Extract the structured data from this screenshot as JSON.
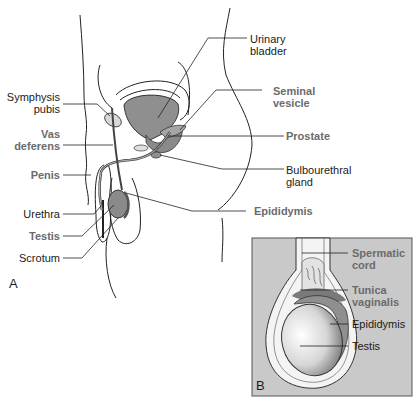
{
  "figure": {
    "panel_a": {
      "letter": "A",
      "labels_left": [
        {
          "id": "symphysis-pubis",
          "line1": "Symphysis",
          "line2": "pubis",
          "emphasis": false
        },
        {
          "id": "vas-deferens",
          "line1": "Vas",
          "line2": "deferens",
          "emphasis": true
        },
        {
          "id": "penis",
          "line1": "Penis",
          "emphasis": true
        },
        {
          "id": "urethra",
          "line1": "Urethra",
          "emphasis": false
        },
        {
          "id": "testis",
          "line1": "Testis",
          "emphasis": true
        },
        {
          "id": "scrotum",
          "line1": "Scrotum",
          "emphasis": false
        }
      ],
      "labels_right": [
        {
          "id": "urinary-bladder",
          "line1": "Urinary",
          "line2": "bladder",
          "emphasis": false
        },
        {
          "id": "seminal-vesicle",
          "line1": "Seminal",
          "line2": "vesicle",
          "emphasis": true
        },
        {
          "id": "prostate",
          "line1": "Prostate",
          "emphasis": true
        },
        {
          "id": "bulbourethral-gland",
          "line1": "Bulbourethral",
          "line2": "gland",
          "emphasis": false
        },
        {
          "id": "epididymis",
          "line1": "Epididymis",
          "emphasis": true
        }
      ]
    },
    "panel_b": {
      "letter": "B",
      "labels": [
        {
          "id": "spermatic-cord",
          "line1": "Spermatic",
          "line2": "cord",
          "emphasis": true
        },
        {
          "id": "tunica-vaginalis",
          "line1": "Tunica",
          "line2": "vaginalis",
          "emphasis": true
        },
        {
          "id": "epididymis-b",
          "line1": "Epididymis",
          "emphasis": false
        },
        {
          "id": "testis-b",
          "line1": "Testis",
          "emphasis": false
        }
      ]
    },
    "colors": {
      "line": "#222222",
      "organ_fill": "#9a9a9a",
      "organ_light": "#c8c8c8",
      "emphasis_text": "#6b6b6b",
      "panel_b_bg": "#c9c9c9"
    }
  }
}
